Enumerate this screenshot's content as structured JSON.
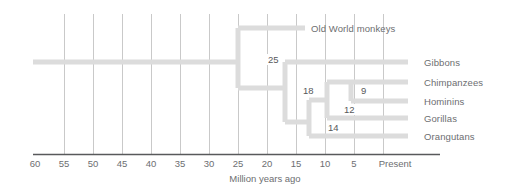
{
  "diagram": {
    "type": "phylogenetic-tree-cladogram",
    "title": "",
    "axis": {
      "label": "Million years ago",
      "ticks": [
        "60",
        "55",
        "50",
        "45",
        "40",
        "35",
        "30",
        "25",
        "20",
        "15",
        "10",
        "5",
        "Present"
      ],
      "tick_values": [
        60,
        55,
        50,
        45,
        40,
        35,
        30,
        25,
        20,
        15,
        10,
        5,
        0
      ],
      "direction": "right-to-left",
      "range": [
        60,
        0
      ],
      "gridlines": true
    },
    "colors": {
      "branch": "#dcdcdc",
      "gridline": "#c9c9c9",
      "axis": "#58595b",
      "text": "#6d6e71"
    },
    "tips": [
      {
        "name": "Old World monkeys",
        "divergence": 25
      },
      {
        "name": "Gibbons",
        "divergence": 18
      },
      {
        "name": "Chimpanzees",
        "divergence": 9
      },
      {
        "name": "Hominins",
        "divergence": 9
      },
      {
        "name": "Gorillas",
        "divergence": 12
      },
      {
        "name": "Orangutans",
        "divergence": 14
      }
    ],
    "nodes": [
      {
        "label": "25",
        "value": 25
      },
      {
        "label": "18",
        "value": 18
      },
      {
        "label": "14",
        "value": 14
      },
      {
        "label": "12",
        "value": 12
      },
      {
        "label": "9",
        "value": 9
      }
    ]
  }
}
